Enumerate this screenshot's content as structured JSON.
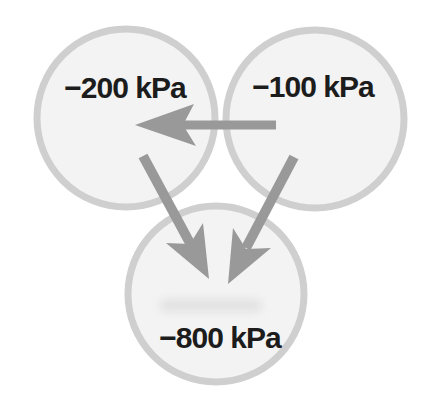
{
  "figure": {
    "cells": [
      {
        "id": "top-left",
        "label": "−200 kPa",
        "value_kpa": -200
      },
      {
        "id": "top-right",
        "label": "−100 kPa",
        "value_kpa": -100
      },
      {
        "id": "bottom",
        "label": "−800 kPa",
        "value_kpa": -800
      }
    ],
    "arrows": [
      {
        "id": "horizontal",
        "from": "top-right",
        "to": "top-left",
        "direction": "left"
      },
      {
        "id": "left-diagonal",
        "from": "top-left",
        "to": "bottom",
        "direction": "down-right"
      },
      {
        "id": "right-diagonal",
        "from": "top-right",
        "to": "bottom",
        "direction": "down-left"
      }
    ]
  },
  "colors": {
    "background": "#ffffff",
    "cell_fill": "#f3f3f3",
    "cell_ring": "#cfcfcf",
    "arrow": "#999999",
    "label_text": "#1c1c1c"
  }
}
